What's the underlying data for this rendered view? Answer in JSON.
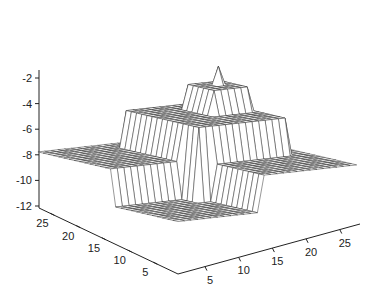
{
  "chart_data": {
    "type": "surface-mesh",
    "title": "",
    "xlabel": "",
    "ylabel": "",
    "zlabel": "",
    "grid_size": [
      28,
      28
    ],
    "x_ticks": [
      5,
      10,
      15,
      20,
      25
    ],
    "y_ticks": [
      5,
      10,
      15,
      20,
      25
    ],
    "z_ticks": [
      -2,
      -4,
      -6,
      -8,
      -10,
      -12
    ],
    "x_range": [
      1,
      28
    ],
    "y_range": [
      1,
      28
    ],
    "z_range": [
      -12,
      -1.5
    ],
    "levels": {
      "base": -8,
      "pit": -11,
      "plateau_1": -5,
      "plateau_2": -3,
      "peak": -1.5
    },
    "regions": {
      "pit": {
        "x": [
          1,
          13
        ],
        "y": [
          1,
          13
        ]
      },
      "plateau_1": {
        "x": [
          12,
          25
        ],
        "y": [
          11,
          25
        ]
      },
      "plateau_2": {
        "x": [
          19,
          24
        ],
        "y": [
          17,
          22
        ]
      },
      "peak": {
        "x": 22,
        "y": 20
      }
    },
    "colors": {
      "mesh": "#333333",
      "fill": "#ffffff",
      "axis": "#222222"
    }
  }
}
